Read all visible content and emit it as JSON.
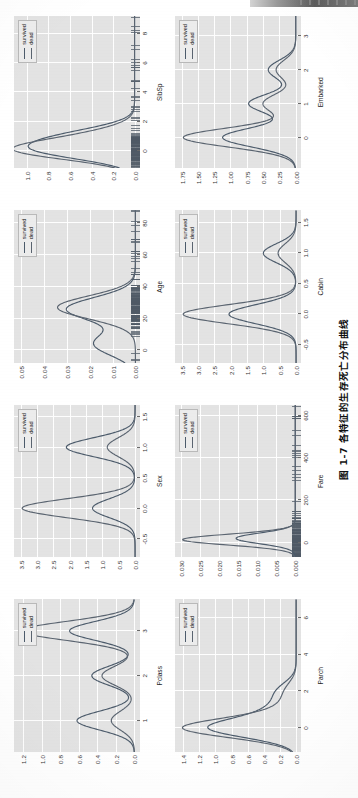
{
  "caption": {
    "label": "图 1-7",
    "text": "各特征的生存死亡分布曲线",
    "full": "图 1-7  各特征的生存死亡分布曲线"
  },
  "legend": {
    "survived_label": "survived",
    "dead_label": "dead",
    "survived_color": "#4c5b6b",
    "dead_color": "#5a6470"
  },
  "chart_data": {
    "type": "line",
    "title": "各特征的生存死亡分布曲线",
    "plot_kind": "kernel density estimate (KDE) distribution curves",
    "legend_position": "top-right inside each panel",
    "grid": true,
    "series_names": [
      "survived",
      "dead"
    ],
    "panels": [
      {
        "name": "Pclass",
        "xlabel": "Pclass",
        "ylabel": "",
        "xticks": [
          "1",
          "2",
          "3"
        ],
        "xtick_values": [
          1,
          2,
          3
        ],
        "yticks": [
          "0.0",
          "0.2",
          "0.4",
          "0.6",
          "0.8",
          "1.0",
          "1.2"
        ],
        "ytick_values": [
          0.0,
          0.2,
          0.4,
          0.6,
          0.8,
          1.0,
          1.2
        ],
        "xlim": [
          0.3,
          3.7
        ],
        "ylim": [
          -0.06,
          1.3
        ],
        "series": [
          {
            "name": "survived",
            "peaks": [
              {
                "x": 1,
                "y": 0.62
              },
              {
                "x": 2,
                "y": 0.46
              },
              {
                "x": 3,
                "y": 0.7
              }
            ]
          },
          {
            "name": "dead",
            "peaks": [
              {
                "x": 1,
                "y": 0.25
              },
              {
                "x": 2,
                "y": 0.35
              },
              {
                "x": 3,
                "y": 1.22
              }
            ]
          }
        ]
      },
      {
        "name": "Sex",
        "xlabel": "Sex",
        "ylabel": "",
        "xticks": [
          "-0.5",
          "0.0",
          "0.5",
          "1.0",
          "1.5"
        ],
        "xtick_values": [
          -0.5,
          0.0,
          0.5,
          1.0,
          1.5
        ],
        "yticks": [
          "0.0",
          "0.5",
          "1.0",
          "1.5",
          "2.0",
          "2.5",
          "3.0",
          "3.5"
        ],
        "ytick_values": [
          0.0,
          0.5,
          1.0,
          1.5,
          2.0,
          2.5,
          3.0,
          3.5
        ],
        "xlim": [
          -0.8,
          1.7
        ],
        "ylim": [
          -0.15,
          3.7
        ],
        "series": [
          {
            "name": "survived",
            "peaks": [
              {
                "x": 0.0,
                "y": 1.3
              },
              {
                "x": 1.0,
                "y": 2.1
              }
            ]
          },
          {
            "name": "dead",
            "peaks": [
              {
                "x": 0.0,
                "y": 3.45
              },
              {
                "x": 1.0,
                "y": 0.85
              }
            ]
          }
        ]
      },
      {
        "name": "Age",
        "xlabel": "Age",
        "ylabel": "",
        "xticks": [
          "0",
          "20",
          "40",
          "60",
          "80"
        ],
        "xtick_values": [
          0,
          20,
          40,
          60,
          80
        ],
        "yticks": [
          "0.00",
          "0.01",
          "0.02",
          "0.03",
          "0.04",
          "0.05"
        ],
        "ytick_values": [
          0.0,
          0.01,
          0.02,
          0.03,
          0.04,
          0.05
        ],
        "xlim": [
          -8,
          88
        ],
        "ylim": [
          -0.002,
          0.053
        ],
        "has_rug": true,
        "series": [
          {
            "name": "survived",
            "peaks": [
              {
                "x": 4,
                "y": 0.018
              },
              {
                "x": 26,
                "y": 0.03
              }
            ]
          },
          {
            "name": "dead",
            "peaks": [
              {
                "x": 27,
                "y": 0.034
              }
            ]
          }
        ]
      },
      {
        "name": "SibSp",
        "xlabel": "SibSp",
        "ylabel": "",
        "xticks": [
          "0",
          "2",
          "4",
          "6",
          "8"
        ],
        "xtick_values": [
          0,
          2,
          4,
          6,
          8
        ],
        "yticks": [
          "0.0",
          "0.2",
          "0.4",
          "0.6",
          "0.8",
          "1.0"
        ],
        "ytick_values": [
          0.0,
          0.2,
          0.4,
          0.6,
          0.8,
          1.0
        ],
        "xlim": [
          -1.2,
          9.2
        ],
        "ylim": [
          -0.05,
          1.12
        ],
        "has_rug": true,
        "series": [
          {
            "name": "survived",
            "peaks": [
              {
                "x": 0,
                "y": 0.78
              },
              {
                "x": 1,
                "y": 0.52
              }
            ]
          },
          {
            "name": "dead",
            "peaks": [
              {
                "x": 0,
                "y": 1.02
              },
              {
                "x": 1,
                "y": 0.33
              }
            ]
          }
        ]
      },
      {
        "name": "Parch",
        "xlabel": "Parch",
        "ylabel": "",
        "xticks": [
          "0",
          "2",
          "4",
          "6"
        ],
        "xtick_values": [
          0,
          2,
          4,
          6
        ],
        "yticks": [
          "0.0",
          "0.2",
          "0.4",
          "0.6",
          "0.8",
          "1.0",
          "1.2",
          "1.4"
        ],
        "ytick_values": [
          0.0,
          0.2,
          0.4,
          0.6,
          0.8,
          1.0,
          1.2,
          1.4
        ],
        "xlim": [
          -1.3,
          7.0
        ],
        "ylim": [
          -0.06,
          1.5
        ],
        "series": [
          {
            "name": "survived",
            "peaks": [
              {
                "x": 0,
                "y": 1.05
              },
              {
                "x": 1,
                "y": 0.27
              },
              {
                "x": 2,
                "y": 0.22
              }
            ]
          },
          {
            "name": "dead",
            "peaks": [
              {
                "x": 0,
                "y": 1.38
              },
              {
                "x": 1,
                "y": 0.18
              },
              {
                "x": 2,
                "y": 0.13
              }
            ]
          }
        ]
      },
      {
        "name": "Fare",
        "xlabel": "Fare",
        "ylabel": "",
        "xticks": [
          "0",
          "200",
          "400",
          "600"
        ],
        "xtick_values": [
          0,
          200,
          400,
          600
        ],
        "yticks": [
          "0.000",
          "0.005",
          "0.010",
          "0.015",
          "0.020",
          "0.025",
          "0.030"
        ],
        "ytick_values": [
          0.0,
          0.005,
          0.01,
          0.015,
          0.02,
          0.025,
          0.03
        ],
        "xlim": [
          -70,
          650
        ],
        "ylim": [
          -0.0015,
          0.0315
        ],
        "has_rug": true,
        "series": [
          {
            "name": "survived",
            "peaks": [
              {
                "x": 18,
                "y": 0.0155
              }
            ]
          },
          {
            "name": "dead",
            "peaks": [
              {
                "x": 12,
                "y": 0.0295
              }
            ]
          }
        ]
      },
      {
        "name": "Cabin",
        "xlabel": "Cabin",
        "ylabel": "",
        "xticks": [
          "-0.5",
          "0.0",
          "0.5",
          "1.0",
          "1.5"
        ],
        "xtick_values": [
          -0.5,
          0.0,
          0.5,
          1.0,
          1.5
        ],
        "yticks": [
          "0.0",
          "0.5",
          "1.0",
          "1.5",
          "2.0",
          "2.5",
          "3.0",
          "3.5"
        ],
        "ytick_values": [
          0.0,
          0.5,
          1.0,
          1.5,
          2.0,
          2.5,
          3.0,
          3.5
        ],
        "xlim": [
          -0.8,
          1.7
        ],
        "ylim": [
          -0.15,
          3.7
        ],
        "series": [
          {
            "name": "survived",
            "peaks": [
              {
                "x": 0.0,
                "y": 2.05
              },
              {
                "x": 1.0,
                "y": 1.0
              }
            ]
          },
          {
            "name": "dead",
            "peaks": [
              {
                "x": 0.0,
                "y": 3.45
              },
              {
                "x": 1.0,
                "y": 0.55
              }
            ]
          }
        ]
      },
      {
        "name": "Embarked",
        "xlabel": "Embarked",
        "ylabel": "",
        "xticks": [
          "0",
          "1",
          "2",
          "3"
        ],
        "xtick_values": [
          0,
          1,
          2,
          3
        ],
        "yticks": [
          "0.00",
          "0.25",
          "0.50",
          "0.75",
          "1.00",
          "1.25",
          "1.50",
          "1.75"
        ],
        "ytick_values": [
          0.0,
          0.25,
          0.5,
          0.75,
          1.0,
          1.25,
          1.5,
          1.75
        ],
        "xlim": [
          -0.9,
          3.6
        ],
        "ylim": [
          -0.08,
          1.85
        ],
        "series": [
          {
            "name": "survived",
            "peaks": [
              {
                "x": 0,
                "y": 1.12
              },
              {
                "x": 1,
                "y": 0.72
              },
              {
                "x": 2,
                "y": 0.42
              }
            ]
          },
          {
            "name": "dead",
            "peaks": [
              {
                "x": 0,
                "y": 1.72
              },
              {
                "x": 1,
                "y": 0.5
              },
              {
                "x": 2,
                "y": 0.3
              }
            ]
          }
        ]
      }
    ]
  }
}
